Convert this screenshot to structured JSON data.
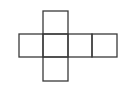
{
  "diagram": {
    "title": "",
    "type": "cube-net",
    "stroke_color": "#3a3a3a",
    "background": "#ffffff",
    "squares": [
      {
        "id": "top",
        "x": 43,
        "y": 11,
        "w": 25,
        "h": 23
      },
      {
        "id": "left",
        "x": 19,
        "y": 34,
        "w": 24,
        "h": 23
      },
      {
        "id": "center",
        "x": 43,
        "y": 34,
        "w": 25,
        "h": 23
      },
      {
        "id": "right1",
        "x": 68,
        "y": 34,
        "w": 24,
        "h": 23
      },
      {
        "id": "right2",
        "x": 92,
        "y": 34,
        "w": 25,
        "h": 23
      },
      {
        "id": "bottom",
        "x": 43,
        "y": 57,
        "w": 25,
        "h": 24
      }
    ]
  }
}
